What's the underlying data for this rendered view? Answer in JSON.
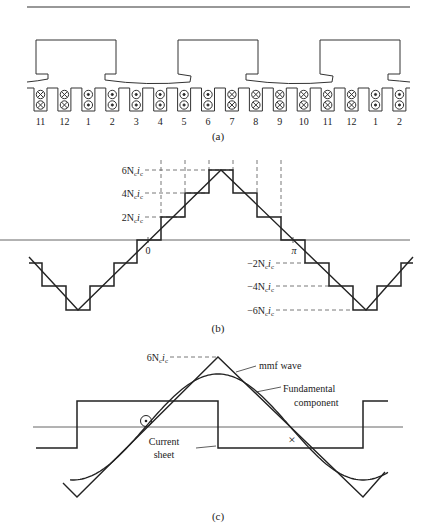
{
  "figure": {
    "part_a": {
      "caption": "(a)",
      "slot_numbers": [
        "11",
        "12",
        "1",
        "2",
        "3",
        "4",
        "5",
        "6",
        "7",
        "8",
        "9",
        "10",
        "11",
        "12",
        "1",
        "2"
      ],
      "slot_symbols": [
        "x",
        "x",
        "dot",
        "dot",
        "dot",
        "dot",
        "dot",
        "dot",
        "x",
        "x",
        "x",
        "x",
        "x",
        "x",
        "dot",
        "dot"
      ]
    },
    "part_b": {
      "caption": "(b)",
      "label_6": "6N",
      "label_4": "4N",
      "label_2": "2N",
      "label_m2": "−2N",
      "label_m4": "−4N",
      "label_m6": "−6N",
      "sub_c": "c",
      "i_char": "i",
      "zero_label": "0",
      "pi_label": "π"
    },
    "part_c": {
      "caption": "(c)",
      "peak_label": "6N",
      "sub_c": "c",
      "i_char": "i",
      "mmf_label": "mmf wave",
      "fundamental_label_1": "Fundamental",
      "fundamental_label_2": "component",
      "current_sheet_label_1": "Current",
      "current_sheet_label_2": "sheet",
      "dot_symbol": "dot",
      "cross_symbol": "×"
    }
  },
  "chart_data": {
    "type": "line",
    "part_b": {
      "xlabel": "",
      "ylabel": "",
      "x_ticks": [
        "0",
        "π"
      ],
      "y_ticks": [
        "6Ncic",
        "4Ncic",
        "2Ncic",
        "−2Ncic",
        "−4Ncic",
        "−6Ncic"
      ],
      "series": [
        {
          "name": "stepped mmf",
          "levels_in_Ncic": [
            -2,
            -4,
            -6,
            -4,
            -2,
            0,
            2,
            4,
            6,
            4,
            2,
            0,
            -2,
            -4,
            -6,
            -4,
            -2
          ]
        },
        {
          "name": "triangular approximation",
          "peak": 6,
          "trough": -6
        }
      ],
      "ylim": [
        -6,
        6
      ]
    },
    "part_c": {
      "series": [
        {
          "name": "Current sheet",
          "shape": "square wave"
        },
        {
          "name": "mmf wave",
          "shape": "triangle",
          "peak": "6Ncic"
        },
        {
          "name": "Fundamental component",
          "shape": "sine"
        }
      ]
    }
  }
}
